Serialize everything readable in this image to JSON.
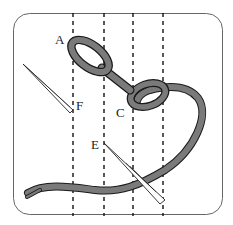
{
  "diagram": {
    "labels": {
      "a": "A",
      "c": "C",
      "e": "E",
      "f": "F"
    },
    "guide_lines": {
      "count": 4,
      "style": "dashed"
    },
    "colors": {
      "thread": "#7a7a7a",
      "outline": "#1a1a1a",
      "frame": "#555555",
      "background": "#ffffff"
    }
  }
}
